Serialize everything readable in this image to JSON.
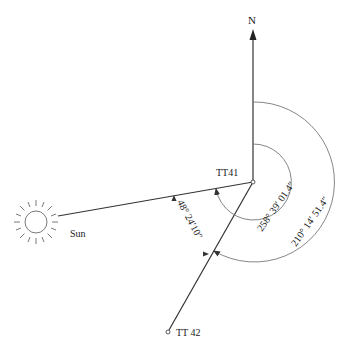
{
  "diagram": {
    "north_label": "N",
    "station_label": "TT41",
    "target_label": "TT 42",
    "sun_label": "Sun",
    "angle_sun_to_tt42": "48° 24′10″",
    "bearing_sun": "258° 39′ 01.4″",
    "bearing_tt42": "210° 14′ 51.4″",
    "line_color": "#333333",
    "arc_color": "#777777"
  }
}
